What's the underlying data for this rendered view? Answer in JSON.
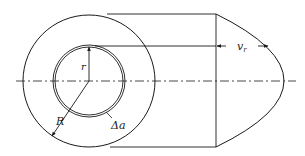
{
  "diagram": {
    "type": "pipe-flow-velocity-profile",
    "labels": {
      "inner_radius": "r",
      "outer_radius": "R",
      "annulus_thickness": "Δa",
      "velocity": "v",
      "velocity_subscript": "r"
    },
    "colors": {
      "line": "#1a1a1a",
      "background": "#ffffff"
    }
  }
}
